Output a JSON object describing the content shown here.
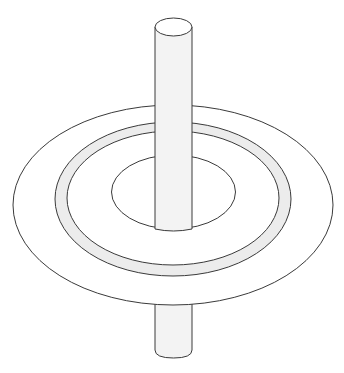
{
  "diagram": {
    "colors": {
      "background": "#ffffff",
      "stroke": "#3a3a3a",
      "rod_fill": "#f3f3f3",
      "ring_fill": "#ececec",
      "disk_fill": "#ffffff"
    },
    "components": [
      {
        "id": "rod",
        "label": "rod"
      },
      {
        "id": "disk",
        "label": "disk"
      },
      {
        "id": "ring",
        "label": "shaded ring"
      },
      {
        "id": "hole",
        "label": "central hole"
      }
    ]
  }
}
